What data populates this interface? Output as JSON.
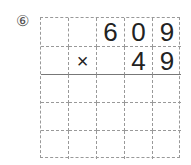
{
  "problem": {
    "number_label": "⑥",
    "operator": "×",
    "multiplicand": [
      "",
      "",
      "6",
      "0",
      "9"
    ],
    "multiplier_row": [
      "",
      "×",
      "",
      "4",
      "9"
    ],
    "answer_rows": [
      [
        "",
        "",
        "",
        "",
        ""
      ],
      [
        "",
        "",
        "",
        "",
        ""
      ],
      [
        "",
        "",
        "",
        "",
        ""
      ]
    ]
  }
}
